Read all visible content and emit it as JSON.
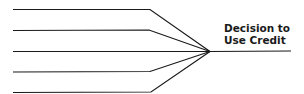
{
  "diagram": {
    "type": "fishbone-converging-lines",
    "label_line1": "Decision to",
    "label_line2": "Use Credit",
    "line_color": "#1a1a1a",
    "input_lines": 5
  }
}
